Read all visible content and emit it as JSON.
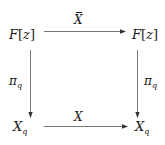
{
  "diagram": {
    "type": "commutative-square",
    "nodes": {
      "top_left": {
        "main": "F",
        "open": "[",
        "var": "z",
        "close": "]"
      },
      "top_right": {
        "main": "F",
        "open": "[",
        "var": "z",
        "close": "]"
      },
      "bottom_left": {
        "main": "X",
        "sub": "q"
      },
      "bottom_right": {
        "main": "X",
        "sub": "q"
      }
    },
    "arrows": {
      "top": {
        "from": "top_left",
        "to": "top_right",
        "label": "X",
        "label_decoration": "bar"
      },
      "bottom": {
        "from": "bottom_left",
        "to": "bottom_right",
        "label": "X"
      },
      "left": {
        "from": "top_left",
        "to": "bottom_left",
        "label_main": "π",
        "label_sub": "q"
      },
      "right": {
        "from": "top_right",
        "to": "bottom_right",
        "label_main": "π",
        "label_sub": "q"
      }
    },
    "colors": {
      "ink": "#1a1a1a",
      "arrow": "#555555",
      "background": "#ffffff"
    }
  }
}
